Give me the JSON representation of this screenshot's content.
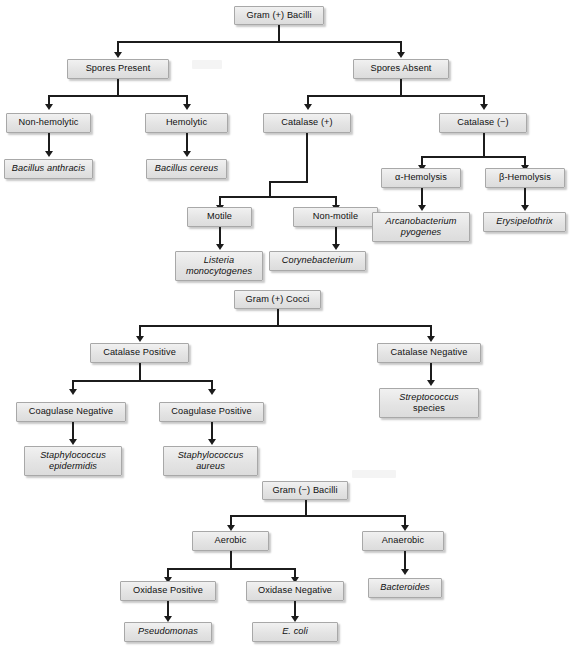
{
  "figure": {
    "box_fill": "#e4e4e4",
    "box_border": "#a8a8a8",
    "line_color": "#1c1c1c",
    "background": "#ffffff"
  },
  "charts": [
    {
      "id": "gram-positive-bacilli",
      "root": "Gram (+) Bacilli",
      "nodes": [
        {
          "key": "root",
          "label": "Gram (+) Bacilli",
          "italic": false
        },
        {
          "key": "spores_present",
          "label": "Spores Present",
          "italic": false
        },
        {
          "key": "spores_absent",
          "label": "Spores Absent",
          "italic": false
        },
        {
          "key": "non_hemolytic",
          "label": "Non-hemolytic",
          "italic": false
        },
        {
          "key": "hemolytic",
          "label": "Hemolytic",
          "italic": false
        },
        {
          "key": "catalase_pos",
          "label": "Catalase (+)",
          "italic": false
        },
        {
          "key": "catalase_neg",
          "label": "Catalase (−)",
          "italic": false
        },
        {
          "key": "bacillus_anthracis",
          "label": "Bacillus anthracis",
          "italic": true
        },
        {
          "key": "bacillus_cereus",
          "label": "Bacillus cereus",
          "italic": true
        },
        {
          "key": "motile",
          "label": "Motile",
          "italic": false
        },
        {
          "key": "non_motile",
          "label": "Non-motile",
          "italic": false
        },
        {
          "key": "alpha_hemolysis",
          "label": "α-Hemolysis",
          "italic": false
        },
        {
          "key": "beta_hemolysis",
          "label": "β-Hemolysis",
          "italic": false
        },
        {
          "key": "listeria_l1",
          "label": "Listeria",
          "italic": true
        },
        {
          "key": "listeria_l2",
          "label": "monocytogenes",
          "italic": true
        },
        {
          "key": "corynebacterium",
          "label": "Corynebacterium",
          "italic": true
        },
        {
          "key": "arcano_l1",
          "label": "Arcanobacterium",
          "italic": true
        },
        {
          "key": "arcano_l2",
          "label": "pyogenes",
          "italic": true
        },
        {
          "key": "erysipelothrix",
          "label": "Erysipelothrix",
          "italic": true
        }
      ]
    },
    {
      "id": "gram-positive-cocci",
      "root": "Gram (+) Cocci",
      "nodes": [
        {
          "key": "root",
          "label": "Gram (+) Cocci",
          "italic": false
        },
        {
          "key": "catalase_pos",
          "label": "Catalase Positive",
          "italic": false
        },
        {
          "key": "catalase_neg",
          "label": "Catalase Negative",
          "italic": false
        },
        {
          "key": "coagulase_neg",
          "label": "Coagulase Negative",
          "italic": false
        },
        {
          "key": "coagulase_pos",
          "label": "Coagulase Positive",
          "italic": false
        },
        {
          "key": "strep_l1",
          "label": "Streptococcus",
          "italic": true
        },
        {
          "key": "strep_l2",
          "label": "species",
          "italic": false
        },
        {
          "key": "staph_epi_l1",
          "label": "Staphylococcus",
          "italic": true
        },
        {
          "key": "staph_epi_l2",
          "label": "epidermidis",
          "italic": true
        },
        {
          "key": "staph_aur_l1",
          "label": "Staphylococcus",
          "italic": true
        },
        {
          "key": "staph_aur_l2",
          "label": "aureus",
          "italic": true
        }
      ]
    },
    {
      "id": "gram-negative-bacilli",
      "root": "Gram (−) Bacilli",
      "nodes": [
        {
          "key": "root",
          "label": "Gram (−) Bacilli",
          "italic": false
        },
        {
          "key": "aerobic",
          "label": "Aerobic",
          "italic": false
        },
        {
          "key": "anaerobic",
          "label": "Anaerobic",
          "italic": false
        },
        {
          "key": "oxidase_pos",
          "label": "Oxidase Positive",
          "italic": false
        },
        {
          "key": "oxidase_neg",
          "label": "Oxidase Negative",
          "italic": false
        },
        {
          "key": "bacteroides",
          "label": "Bacteroides",
          "italic": true
        },
        {
          "key": "pseudomonas",
          "label": "Pseudomonas",
          "italic": true
        },
        {
          "key": "ecoli",
          "label": "E. coli",
          "italic": true
        }
      ]
    }
  ]
}
